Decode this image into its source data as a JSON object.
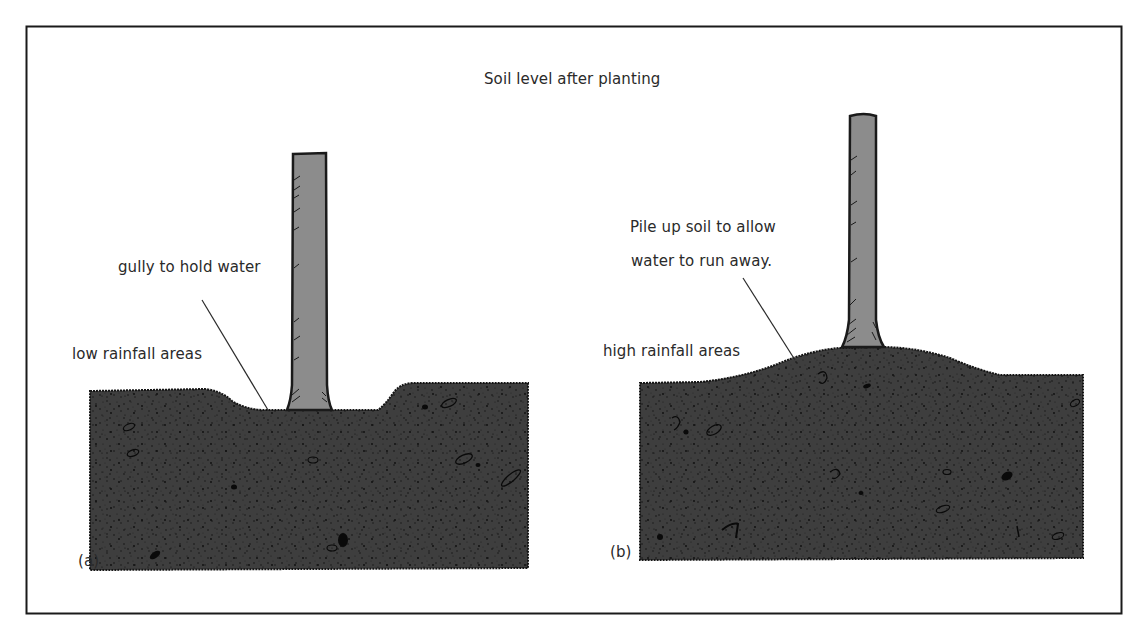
{
  "title": "Soil level after planting",
  "panels": [
    {
      "id": "a",
      "tag": "(a)",
      "area_label": "low rainfall areas",
      "annotation": "gully to hold water",
      "soil_profile": "gully"
    },
    {
      "id": "b",
      "tag": "(b)",
      "area_label": "high rainfall areas",
      "annotation_lines": [
        "Pile up soil to allow",
        "water to run away."
      ],
      "soil_profile": "mound"
    }
  ],
  "colors": {
    "frame": "#1a1a1a",
    "soil": "#3d3d3d",
    "soil_speckle": "#111111",
    "trunk": "#8c8c8c",
    "trunk_outline": "#1a1a1a",
    "text": "#2a2a2a"
  }
}
